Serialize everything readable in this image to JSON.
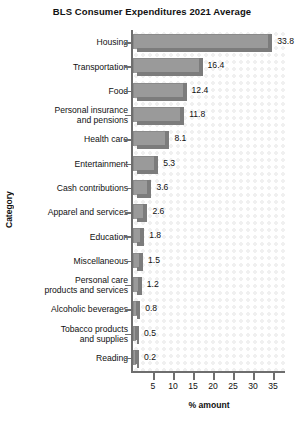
{
  "chart_data": {
    "type": "bar",
    "orientation": "horizontal",
    "title": "BLS Consumer Expenditures 2021 Average",
    "xlabel": "% amount",
    "ylabel": "Category",
    "xlim": [
      0,
      38
    ],
    "xticks": [
      5,
      10,
      15,
      20,
      25,
      30,
      35
    ],
    "xtick_labels": [
      "5",
      "10",
      "15",
      "20",
      "25",
      "30",
      "35"
    ],
    "grid": false,
    "legend": null,
    "categories": [
      "Housing",
      "Transportation",
      "Food",
      "Personal insurance\nand pensions",
      "Health care",
      "Entertainment",
      "Cash contributions",
      "Apparel and services",
      "Education",
      "Miscellaneous",
      "Personal care\nproducts and services",
      "Alcoholic beverages",
      "Tobacco products\nand supplies",
      "Reading"
    ],
    "values": [
      33.8,
      16.4,
      12.4,
      11.8,
      8.1,
      5.3,
      3.6,
      2.6,
      1.8,
      1.5,
      1.2,
      0.8,
      0.5,
      0.2
    ],
    "value_labels": [
      "33.8",
      "16.4",
      "12.4",
      "11.8",
      "8.1",
      "5.3",
      "3.6",
      "2.6",
      "1.8",
      "1.5",
      "1.2",
      "0.8",
      "0.5",
      "0.2"
    ],
    "colors": {
      "bar_fill": "#9a9a9a",
      "bar_shadow": "#7c7c7c",
      "axis": "#6e6e6e",
      "text": "#111111",
      "plot_background": "#ffffff",
      "dot_texture": "#f0f0f0"
    }
  }
}
